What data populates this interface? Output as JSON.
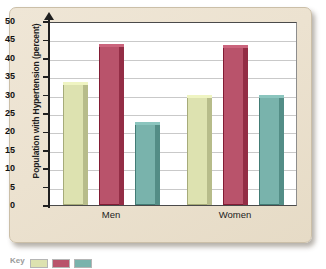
{
  "chart_data": {
    "type": "bar",
    "title": "",
    "xlabel": "",
    "ylabel": "Population with Hypertension (percent)",
    "categories": [
      "Men",
      "Women"
    ],
    "series": [
      {
        "name": "series-1",
        "color": "#dde2b0",
        "values": [
          33.5,
          30.0
        ]
      },
      {
        "name": "series-2",
        "color": "#b9536b",
        "values": [
          43.8,
          43.5
        ]
      },
      {
        "name": "series-3",
        "color": "#79b3ac",
        "values": [
          22.5,
          30.0
        ]
      }
    ],
    "ylim": [
      0,
      50
    ],
    "yticks": [
      0,
      5,
      10,
      15,
      20,
      25,
      30,
      35,
      40,
      45,
      50
    ],
    "ytick_labels": [
      "0",
      "5",
      "10",
      "15",
      "20",
      "25",
      "30",
      "35",
      "40",
      "45",
      "50"
    ],
    "grid": true,
    "legend_position": "below-bottom-left"
  },
  "axis": {
    "y_title": "Population with Hypertension (percent)",
    "ticks": [
      "50",
      "45",
      "40",
      "35",
      "30",
      "25",
      "20",
      "15",
      "10",
      "5",
      "0"
    ]
  },
  "categories": [
    {
      "label": "Men"
    },
    {
      "label": "Women"
    }
  ],
  "legend": {
    "label": "Key",
    "swatch_colors": [
      "#dde2b0",
      "#b9536b",
      "#79b3ac"
    ]
  },
  "colors": {
    "panel_background": "#ece2d0",
    "plot_background": "#ffffff",
    "gridline": "#c9c9c9",
    "axis": "#1f1f1f",
    "series_1": "#dde2b0",
    "series_2": "#b9536b",
    "series_3": "#79b3ac"
  }
}
